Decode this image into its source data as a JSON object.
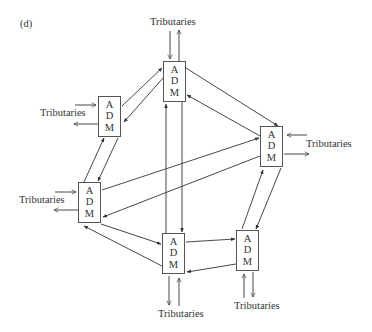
{
  "panel_label": "(d)",
  "node_letters": [
    "A",
    "D",
    "M"
  ],
  "nodes": [
    {
      "id": "top",
      "letters": [
        "A",
        "D",
        "M"
      ],
      "tributaries": "Tributaries"
    },
    {
      "id": "upper-left",
      "letters": [
        "A",
        "D",
        "M"
      ],
      "tributaries": "Tributaries"
    },
    {
      "id": "right",
      "letters": [
        "A",
        "D",
        "M"
      ],
      "tributaries": "Tributaries"
    },
    {
      "id": "left",
      "letters": [
        "A",
        "D",
        "M"
      ],
      "tributaries": "Tributaries"
    },
    {
      "id": "bottom-center",
      "letters": [
        "A",
        "D",
        "M"
      ],
      "tributaries": "Tributaries"
    },
    {
      "id": "bottom-right",
      "letters": [
        "A",
        "D",
        "M"
      ],
      "tributaries": "Tributaries"
    }
  ],
  "edges": [
    {
      "from": "upper-left",
      "to": "top"
    },
    {
      "from": "top",
      "to": "upper-left"
    },
    {
      "from": "top",
      "to": "right"
    },
    {
      "from": "right",
      "to": "top"
    },
    {
      "from": "upper-left",
      "to": "left"
    },
    {
      "from": "left",
      "to": "upper-left"
    },
    {
      "from": "left",
      "to": "right"
    },
    {
      "from": "right",
      "to": "left"
    },
    {
      "from": "top",
      "to": "bottom-center"
    },
    {
      "from": "bottom-center",
      "to": "top"
    },
    {
      "from": "left",
      "to": "bottom-center"
    },
    {
      "from": "bottom-center",
      "to": "left"
    },
    {
      "from": "bottom-center",
      "to": "bottom-right"
    },
    {
      "from": "bottom-right",
      "to": "bottom-center"
    },
    {
      "from": "bottom-right",
      "to": "right"
    },
    {
      "from": "right",
      "to": "bottom-right"
    }
  ]
}
